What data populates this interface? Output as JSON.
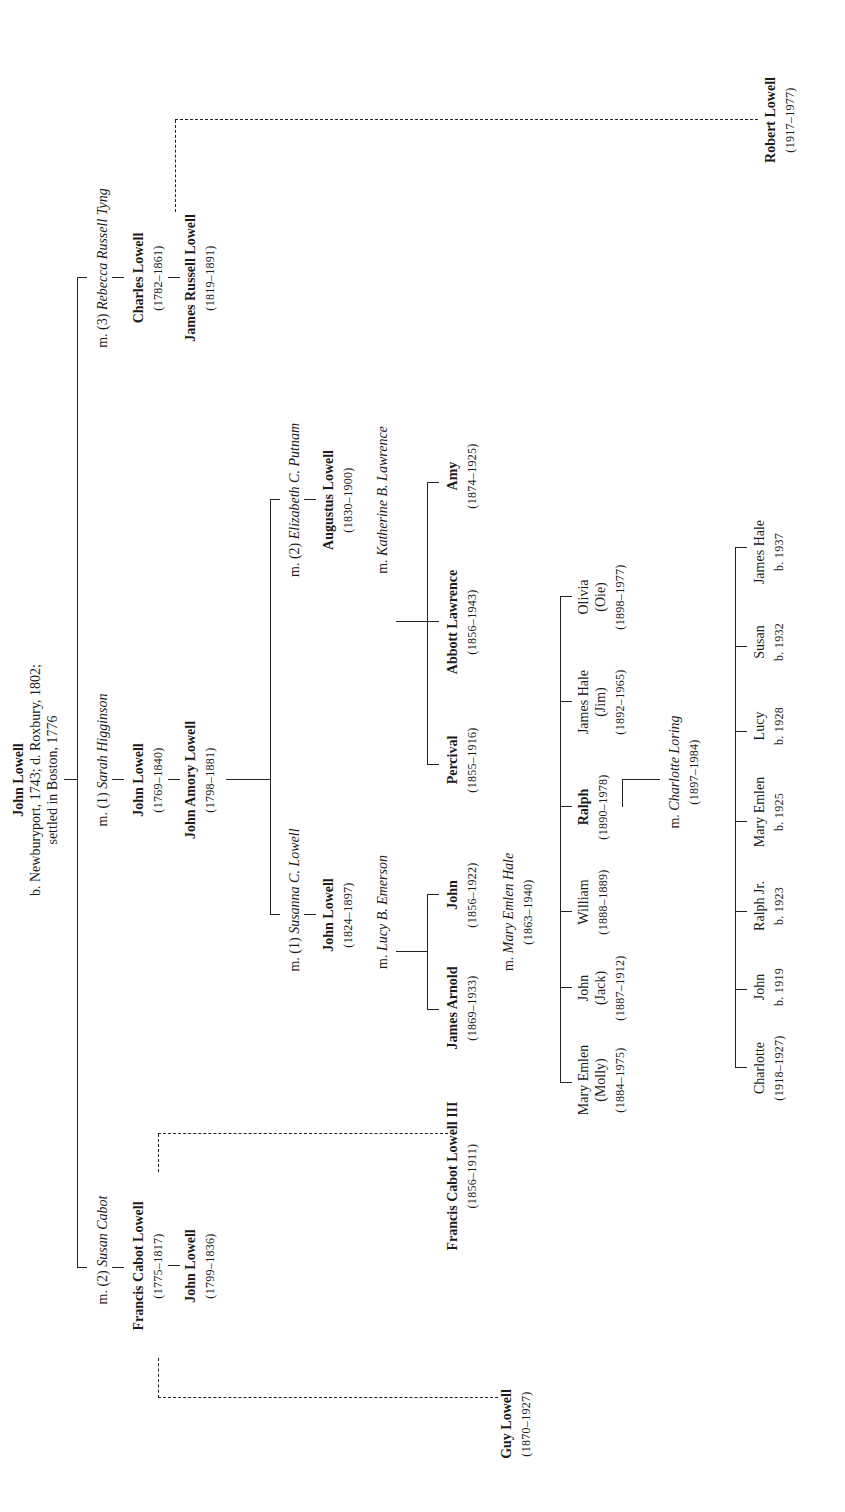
{
  "root": {
    "name": "John Lowell",
    "line1": "b. Newburyport, 1743; d. Roxbury, 1802;",
    "line2": "settled in Boston, 1776"
  },
  "marriages": {
    "m1": {
      "prefix": "m. (1)",
      "spouse": "Sarah Higginson"
    },
    "m2": {
      "prefix": "m. (2)",
      "spouse": "Susan Cabot"
    },
    "m3": {
      "prefix": "m. (3)",
      "spouse": "Rebecca Russell Tyng"
    },
    "ja_m1": {
      "prefix": "m. (1)",
      "spouse": "Susanna C. Lowell"
    },
    "ja_m2": {
      "prefix": "m. (2)",
      "spouse": "Elizabeth C. Putnam"
    },
    "jl_m": {
      "prefix": "m.",
      "spouse": "Lucy B. Emerson"
    },
    "al_m": {
      "prefix": "m.",
      "spouse": "Katherine B. Lawrence"
    },
    "john_m": {
      "prefix": "m.",
      "spouse": "Mary Emlen Hale",
      "dates": "(1863–1940)"
    },
    "ralph_m": {
      "prefix": "m.",
      "spouse": "Charlotte Loring",
      "dates": "(1897–1984)"
    }
  },
  "people": {
    "fcl": {
      "name": "Francis Cabot Lowell",
      "dates": "(1775–1817)"
    },
    "jl1799": {
      "name": "John Lowell",
      "dates": "(1799–1836)"
    },
    "jl1769": {
      "name": "John Lowell",
      "dates": "(1769–1840)"
    },
    "jal": {
      "name": "John Amory Lowell",
      "dates": "(1798–1881)"
    },
    "cl": {
      "name": "Charles Lowell",
      "dates": "(1782–1861)"
    },
    "jrl": {
      "name": "James Russell Lowell",
      "dates": "(1819–1891)"
    },
    "jl1824": {
      "name": "John Lowell",
      "dates": "(1824–1897)"
    },
    "aug": {
      "name": "Augustus Lowell",
      "dates": "(1830–1900)"
    },
    "fcl3": {
      "name": "Francis Cabot Lowell III",
      "dates": "(1856–1911)"
    },
    "jarnold": {
      "name": "James Arnold",
      "dates": "(1869–1933)"
    },
    "john1856": {
      "name": "John",
      "dates": "(1856–1922)"
    },
    "percival": {
      "name": "Percival",
      "dates": "(1855–1916)"
    },
    "abbott": {
      "name": "Abbott Lawrence",
      "dates": "(1856–1943)"
    },
    "amy": {
      "name": "Amy",
      "dates": "(1874–1925)"
    },
    "guy": {
      "name": "Guy Lowell",
      "dates": "(1870–1927)"
    },
    "robert": {
      "name": "Robert Lowell",
      "dates": "(1917–1977)"
    }
  },
  "children_john1856": [
    {
      "name": "Mary Emlen",
      "nick": "(Molly)",
      "dates": "(1884–1975)"
    },
    {
      "name": "John",
      "nick": "(Jack)",
      "dates": "(1887–1912)"
    },
    {
      "name": "William",
      "nick": "",
      "dates": "(1888–1889)"
    },
    {
      "name": "Ralph",
      "nick": "",
      "dates": "(1890–1978)"
    },
    {
      "name": "James Hale",
      "nick": "(Jim)",
      "dates": "(1892–1965)"
    },
    {
      "name": "Olivia",
      "nick": "(Oie)",
      "dates": "(1898–1977)"
    }
  ],
  "children_ralph": [
    {
      "name": "Charlotte",
      "dates": "(1918–1927)"
    },
    {
      "name": "John",
      "dates": "b. 1919"
    },
    {
      "name": "Ralph Jr.",
      "dates": "b. 1923"
    },
    {
      "name": "Mary Emlen",
      "dates": "b. 1925"
    },
    {
      "name": "Lucy",
      "dates": "b. 1928"
    },
    {
      "name": "Susan",
      "dates": "b. 1932"
    },
    {
      "name": "James Hale",
      "dates": "b. 1937"
    }
  ]
}
